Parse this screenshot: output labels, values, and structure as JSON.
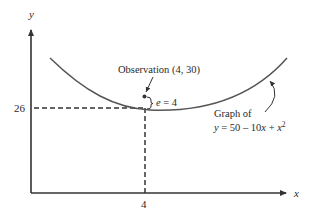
{
  "diagram": {
    "axes": {
      "y_label": "y",
      "x_label": "x"
    },
    "ticks": {
      "y_tick": "26",
      "x_tick": "4"
    },
    "observation": {
      "label": "Observation (4, 30)",
      "x": 4,
      "y": 30
    },
    "error": {
      "label_var": "e",
      "label_rest": " = 4"
    },
    "curve": {
      "label_line1": "Graph of",
      "equation_y": "y",
      "equation_mid": " = 50 – 10",
      "equation_x1": "x",
      "equation_plus": " + ",
      "equation_x2": "x",
      "equation_exp": "2"
    },
    "colors": {
      "curve": "#555555",
      "axis": "#333333",
      "text": "#2a2a2a"
    }
  }
}
